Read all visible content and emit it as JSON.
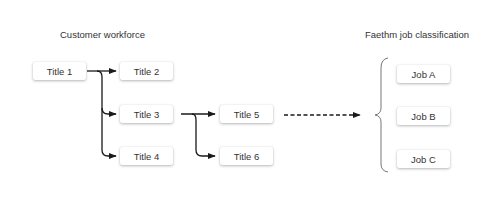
{
  "headings": {
    "left": "Customer workforce",
    "right": "Faethm job classification"
  },
  "titles": [
    "Title 1",
    "Title 2",
    "Title 3",
    "Title 4",
    "Title 5",
    "Title 6"
  ],
  "jobs": [
    "Job A",
    "Job B",
    "Job C"
  ],
  "colors": {
    "line": "#1a1a1a",
    "brace": "#777777",
    "box_bg": "#ffffff",
    "text": "#333333"
  }
}
